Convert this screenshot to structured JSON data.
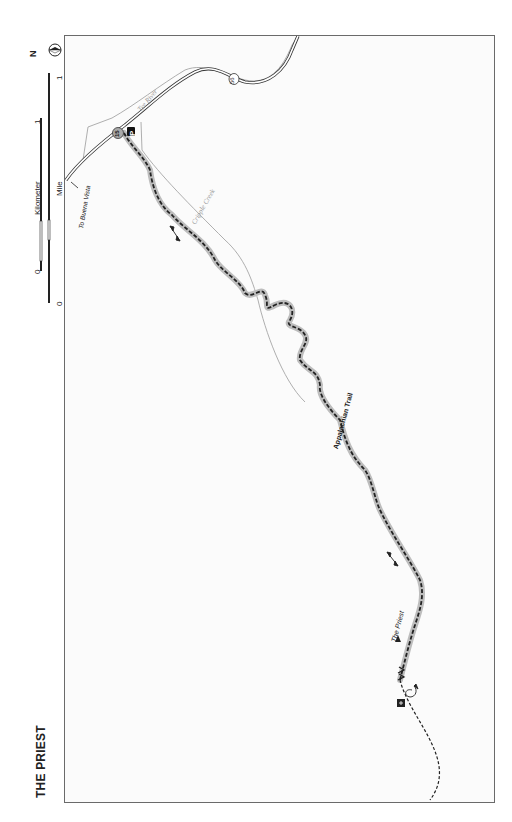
{
  "map": {
    "title": "THE PRIEST",
    "legend": {
      "north_arrow": "N",
      "scale": {
        "kilometer_label": "Kilometer",
        "kilometer_start": "0",
        "kilometer_end": "1",
        "mile_label": "Mile",
        "mile_start": "0",
        "mile_end": "1"
      }
    },
    "labels": {
      "river": "Tye River",
      "creek": "Cripple Creek",
      "trail": "Appalachian Trail",
      "peak": "The Priest",
      "direction": "To Buena Vista"
    },
    "route_markers": {
      "state_route": "56",
      "trailhead_number": "15",
      "parking": "P"
    },
    "colors": {
      "trail": "#222222",
      "trail_halo": "#b8b8b8",
      "water": "#9a9a9a",
      "road": "#333333",
      "frame": "#6a6a6a"
    }
  }
}
